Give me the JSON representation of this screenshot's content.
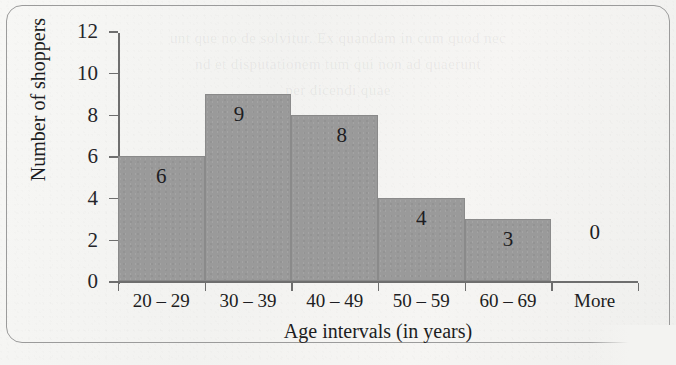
{
  "chart_data": {
    "type": "bar",
    "title": "",
    "subtitle": "",
    "xlabel": "Age intervals (in years)",
    "ylabel": "Number of shoppers",
    "categories": [
      "20 – 29",
      "30 – 39",
      "40 – 49",
      "50 – 59",
      "60 – 69",
      "More"
    ],
    "values": [
      6,
      9,
      8,
      4,
      3,
      0
    ],
    "value_labels": [
      "6",
      "9",
      "8",
      "4",
      "3",
      "0"
    ],
    "ylim": [
      0,
      12
    ],
    "yticks": [
      0,
      2,
      4,
      6,
      8,
      10,
      12
    ],
    "ytick_labels": [
      "0",
      "2",
      "4",
      "6",
      "8",
      "10",
      "12"
    ],
    "grid": false,
    "legend": false,
    "legend_position": "none",
    "bar_color": "#9a9a9a",
    "axis_color": "#6e6e6e",
    "text_color": "#1d1d22",
    "background_color": "#f4f4f2",
    "border_color": "#9b9b9b",
    "bars_adjacent": true,
    "annotations": []
  },
  "background_ghost_text": {
    "line1": "unt que no de solvitur. Ex quandam in cum quod nec",
    "line2": "nd et disputationem tum qui non ad quaerunt",
    "line3": "per dicendi quae"
  }
}
